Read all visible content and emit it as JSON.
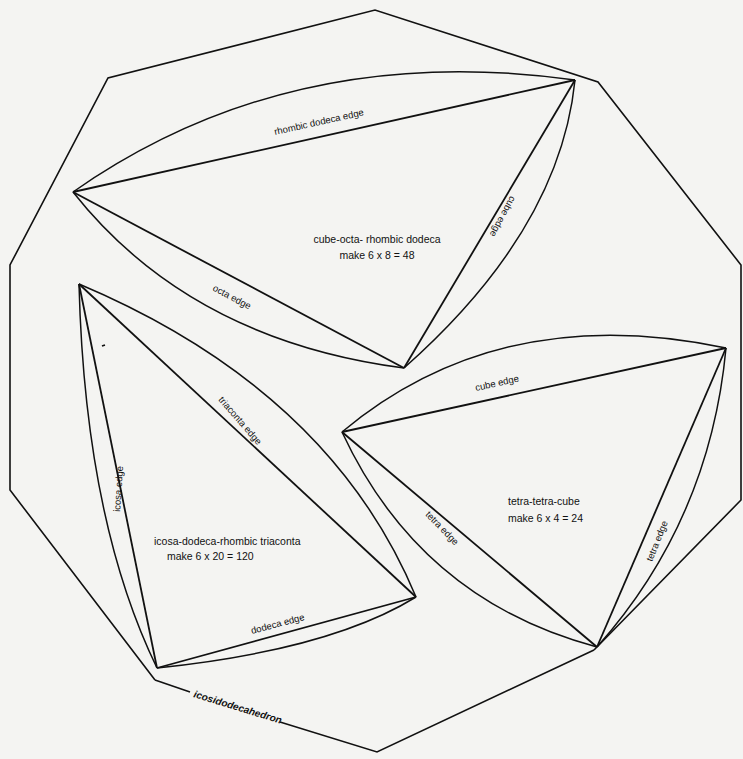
{
  "diagram": {
    "outline_label": "icosidodecahedron",
    "pieces": [
      {
        "id": "cube-octa-rhombic-dodeca",
        "title": "cube-octa- rhombic dodeca",
        "make": "make 6 x 8 = 48",
        "edges": {
          "top": "rhombic dodeca edge",
          "right": "cube edge",
          "left": "octa edge"
        }
      },
      {
        "id": "icosa-dodeca-rhombic-triaconta",
        "title": "icosa-dodeca-rhombic triaconta",
        "make": "make 6 x 20 = 120",
        "edges": {
          "diagonal": "triaconta edge",
          "left": "icosa edge",
          "bottom": "dodeca edge"
        }
      },
      {
        "id": "tetra-tetra-cube",
        "title": "tetra-tetra-cube",
        "make": "make 6 x 4 = 24",
        "edges": {
          "top": "cube edge",
          "left": "tetra edge",
          "right": "tetra  edge"
        }
      }
    ]
  }
}
